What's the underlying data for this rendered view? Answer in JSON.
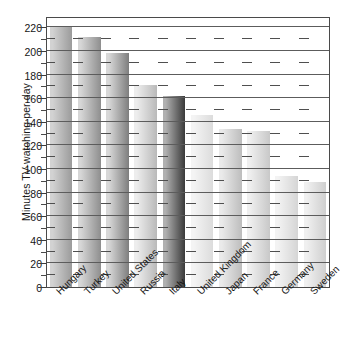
{
  "chart_data": {
    "type": "bar",
    "title": "",
    "xlabel": "",
    "ylabel": "Minutes TV-watching per day",
    "categories": [
      "Hungary",
      "Turkey",
      "United States",
      "Russia",
      "Italy",
      "United Kingdom",
      "Japan",
      "France",
      "Germany",
      "Sweden"
    ],
    "values": [
      221,
      212,
      198,
      171,
      162,
      146,
      134,
      132,
      94,
      89
    ],
    "ylim": [
      0,
      228
    ],
    "ytick_labels": [
      "0",
      "20",
      "40",
      "60",
      "80",
      "100",
      "120",
      "140",
      "160",
      "180",
      "200",
      "220"
    ],
    "ytick_values": [
      0,
      20,
      40,
      60,
      80,
      100,
      120,
      140,
      160,
      180,
      200,
      220
    ],
    "minor_tick_step": 10,
    "grid": "horizontal",
    "legend": "none",
    "bar_shading": [
      {
        "name": "Hungary",
        "from": "#d2d2d2",
        "to": "#9b9b9b"
      },
      {
        "name": "Turkey",
        "from": "#d6d6d6",
        "to": "#8e8e8e"
      },
      {
        "name": "United States",
        "from": "#d8d8d8",
        "to": "#7e7e7e"
      },
      {
        "name": "Russia",
        "from": "#ededed",
        "to": "#b9b9b9"
      },
      {
        "name": "Italy",
        "from": "#b0b0b0",
        "to": "#3a3a3a"
      },
      {
        "name": "United Kingdom",
        "from": "#f4f4f4",
        "to": "#dcdcdc"
      },
      {
        "name": "Japan",
        "from": "#eaeaea",
        "to": "#bdbdbd"
      },
      {
        "name": "France",
        "from": "#efefef",
        "to": "#c8c8c8"
      },
      {
        "name": "Germany",
        "from": "#f3f3f3",
        "to": "#d5d5d5"
      },
      {
        "name": "Sweden",
        "from": "#f0f0f0",
        "to": "#cfcfcf"
      }
    ],
    "colors": {
      "axis": "#4a4a4a",
      "grid": "#5c5c5c",
      "text": "#161616",
      "background": "#ffffff"
    }
  }
}
